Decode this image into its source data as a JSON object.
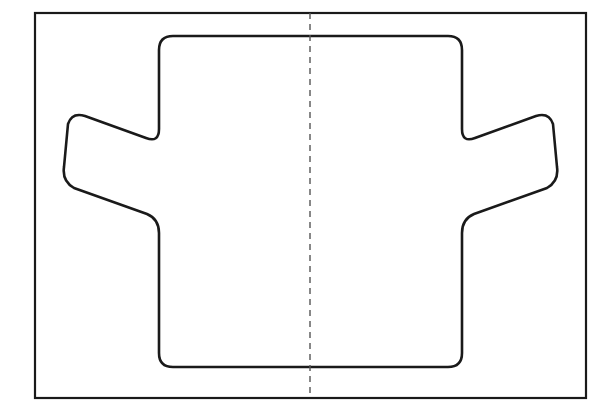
{
  "document": {
    "title": "Symmetric Part Outline",
    "type": "technical-line-drawing",
    "background_color": "#ffffff",
    "width": 614,
    "height": 414
  },
  "style": {
    "outline_color": "#1a1a1a",
    "outline_width": 2.6,
    "border_color": "#1a1a1a",
    "border_width": 2.2,
    "centerline_color": "#555555",
    "centerline_width": 1.4,
    "centerline_dash": "6 5",
    "fill_color": "#ffffff"
  },
  "frame": {
    "label": "drawing-border-rectangle",
    "x": 35,
    "y": 13,
    "width": 551,
    "height": 385
  },
  "centerline": {
    "label": "vertical-axis-of-symmetry",
    "x": 310,
    "y_start": 13,
    "y_end": 398,
    "style": "dashed"
  },
  "part": {
    "label": "symmetric-cross-profile",
    "axis_x": 310.5,
    "corner_radius_main": 14,
    "corner_radius_ear": 13,
    "body": {
      "left_x": 159,
      "right_x": 462,
      "top_y": 36,
      "bottom_y": 367
    },
    "ear_left": {
      "outer_x": 62,
      "top_outer_y": 122,
      "bottom_outer_y": 188,
      "top_inner_y": 143,
      "bottom_inner_y": 215
    },
    "ear_right": {
      "outer_x": 559,
      "top_outer_y": 122,
      "bottom_outer_y": 188,
      "top_inner_y": 143,
      "bottom_inner_y": 215
    },
    "path": "M 173 36 L 448 36 Q 462 36 462 50 L 462 129 Q 462 143 475 138 L 536 116 Q 549 112 553 124 L 557 167 Q 559 181 547 188 L 474 214 Q 462 219 462 233 L 462 353 Q 462 367 448 367 L 173 367 Q 159 367 159 353 L 159 233 Q 159 219 147 214 L 74 188 Q 62 181 64 167 L 68 124 Q 72 112 85 116 L 146 138 Q 159 143 159 129 L 159 50 Q 159 36 173 36 Z"
  }
}
